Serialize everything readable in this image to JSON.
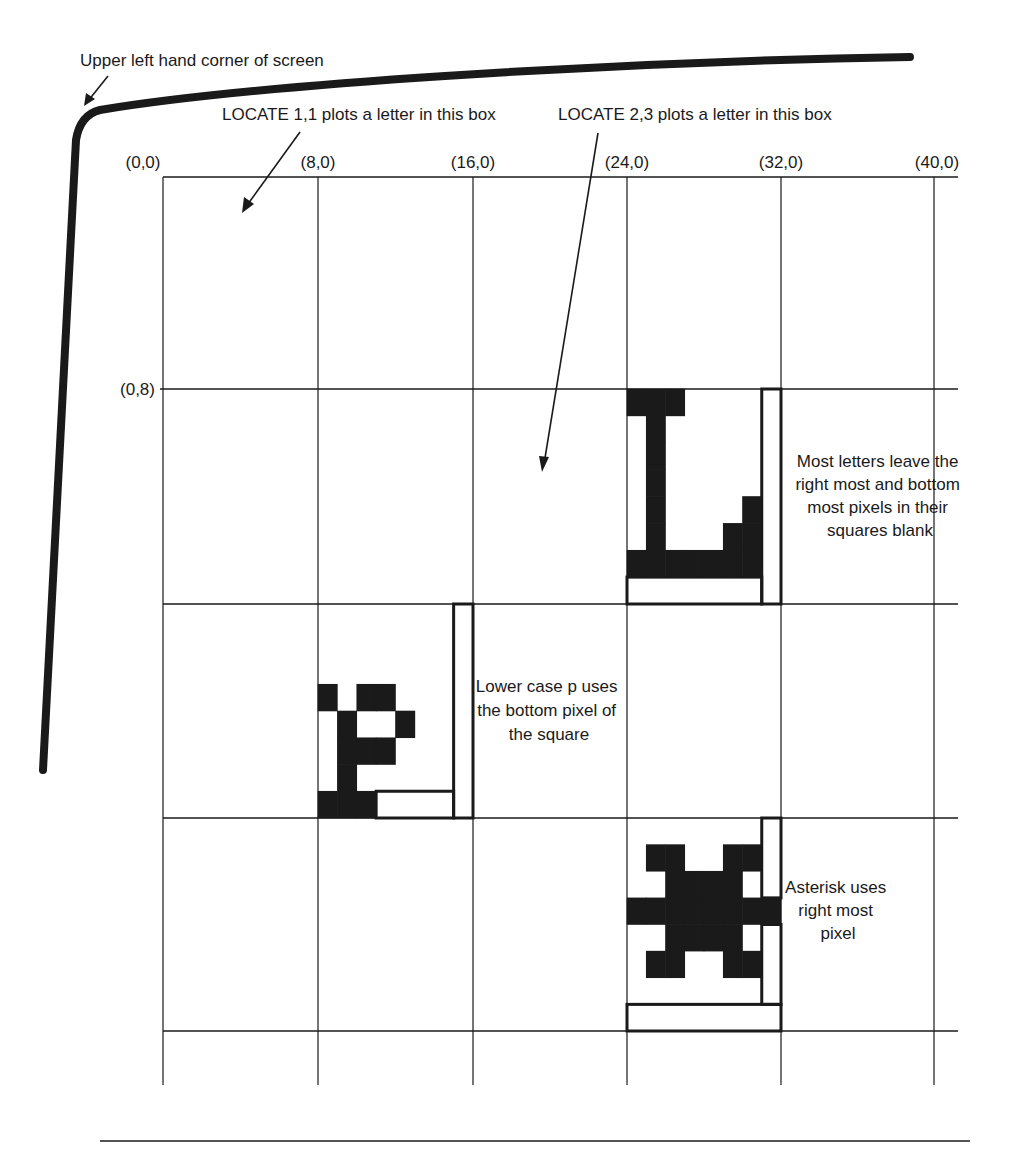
{
  "diagram": {
    "title_hint": "Character cell layout on screen",
    "colors": {
      "ink": "#1a1a1a",
      "background": "#ffffff"
    },
    "labels": {
      "screen_corner": "Upper left hand corner of screen",
      "locate_1_1": "LOCATE 1,1 plots a letter in this box",
      "locate_2_3": "LOCATE 2,3 plots a letter in this box",
      "most_letters": [
        "Most letters leave the",
        "right most and bottom",
        "most pixels in their",
        "squares blank"
      ],
      "lower_p": [
        "Lower case p uses",
        "the bottom pixel of",
        "the square"
      ],
      "asterisk": [
        "Asterisk uses",
        "right most",
        "pixel"
      ]
    },
    "coords": {
      "top": [
        "(0,0)",
        "(8,0)",
        "(16,0)",
        "(24,0)",
        "(32,0)",
        "(40,0)"
      ],
      "left": [
        "(0,8)"
      ]
    },
    "grid": {
      "columns": 5,
      "rows": 4,
      "pixels_per_cell": 8
    },
    "glyphs": [
      {
        "name": "letter-L",
        "cell": {
          "col": 3,
          "row": 1
        },
        "description": "Letter L leaves right-most column and bottom row blank",
        "bitmap": [
          "11100000",
          "01000000",
          "01000000",
          "01000000",
          "01000010",
          "01000110",
          "11111110",
          "00000000"
        ],
        "outline": [
          {
            "col": 7,
            "row": 0,
            "cols": 1,
            "rows": 8
          },
          {
            "col": 0,
            "row": 7,
            "cols": 7,
            "rows": 1
          }
        ]
      },
      {
        "name": "lowercase-p",
        "cell": {
          "col": 1,
          "row": 2
        },
        "description": "Lower case p uses bottom pixel row",
        "bitmap": [
          "00000000",
          "00000000",
          "00000000",
          "10110000",
          "01001000",
          "01110000",
          "01000000",
          "11100000"
        ],
        "outline": [
          {
            "col": 7,
            "row": 0,
            "cols": 1,
            "rows": 8
          },
          {
            "col": 3,
            "row": 7,
            "cols": 4,
            "rows": 1
          }
        ]
      },
      {
        "name": "asterisk",
        "cell": {
          "col": 3,
          "row": 3
        },
        "description": "Asterisk uses right-most pixel column",
        "bitmap": [
          "00000000",
          "01100110",
          "00111100",
          "11111111",
          "00111100",
          "01100110",
          "00000000",
          "00000000"
        ],
        "outline": [
          {
            "col": 7,
            "row": 0,
            "cols": 1,
            "rows": 3
          },
          {
            "col": 7,
            "row": 4,
            "cols": 1,
            "rows": 3
          },
          {
            "col": 0,
            "row": 7,
            "cols": 8,
            "rows": 1
          }
        ]
      }
    ]
  }
}
